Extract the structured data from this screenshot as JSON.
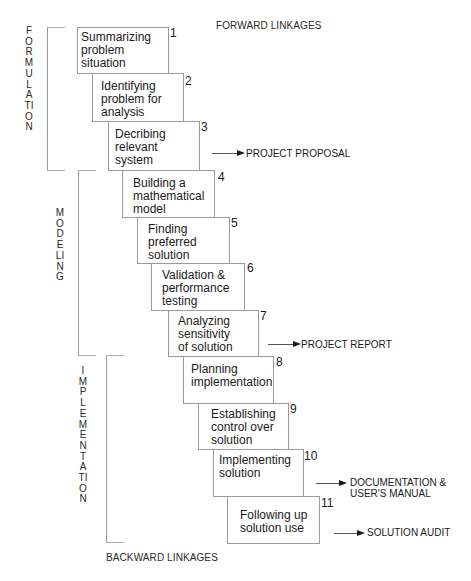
{
  "headings": {
    "forward": "FORWARD LINKAGES",
    "backward": "BACKWARD LINKAGES"
  },
  "phases": [
    {
      "name": "FORMULATION",
      "steps": [
        1,
        2,
        3
      ]
    },
    {
      "name": "MODELING",
      "steps": [
        4,
        5,
        6,
        7
      ]
    },
    {
      "name": "IMPLEMENTATION",
      "steps": [
        8,
        9,
        10,
        11
      ]
    }
  ],
  "steps": [
    {
      "num": "1",
      "text": "Summarizing\nproblem\nsituation"
    },
    {
      "num": "2",
      "text": "Identifying\nproblem for\nanalysis"
    },
    {
      "num": "3",
      "text": "Decribing\nrelevant\nsystem"
    },
    {
      "num": "4",
      "text": "Building a\nmathematical\nmodel"
    },
    {
      "num": "5",
      "text": "Finding\npreferred\nsolution"
    },
    {
      "num": "6",
      "text": "Validation &\nperformance\ntesting"
    },
    {
      "num": "7",
      "text": "Analyzing\nsensitivity\nof solution"
    },
    {
      "num": "8",
      "text": "Planning\nimplementation"
    },
    {
      "num": "9",
      "text": "Establishing\ncontrol over\nsolution"
    },
    {
      "num": "10",
      "text": "Implementing\nsolution"
    },
    {
      "num": "11",
      "text": "Following up\nsolution use"
    }
  ],
  "outputs": [
    {
      "after_step": "3",
      "label": "PROJECT PROPOSAL"
    },
    {
      "after_step": "7",
      "label": "PROJECT REPORT"
    },
    {
      "after_step": "10",
      "label": "DOCUMENTATION &\nUSER'S MANUAL"
    },
    {
      "after_step": "11",
      "label": "SOLUTION AUDIT"
    }
  ]
}
